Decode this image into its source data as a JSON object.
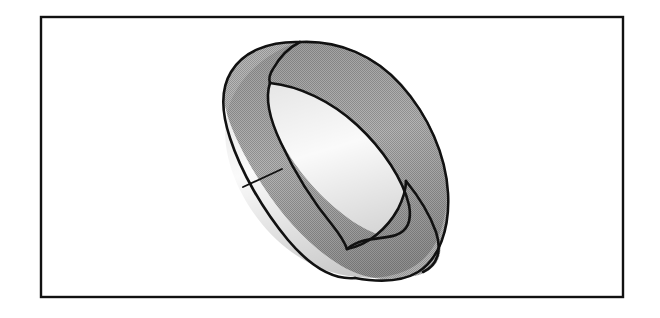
{
  "figure": {
    "title": "Mobius strip",
    "caption": "",
    "background_color": "#ffffff",
    "frame": {
      "name": "figure-border",
      "x": 41,
      "y": 17,
      "width": 582,
      "height": 280,
      "stroke_color": "#111111",
      "stroke_width": 2.4,
      "fill": "none"
    },
    "band": {
      "name": "mobius-band",
      "fill_color": "#ababab",
      "stroke_color": "#111111",
      "stroke_width": 2.6,
      "hole_color": "#ffffff",
      "description": "Gray shaded Mobius strip, one half-twist, viewed obliquely",
      "bounds": {
        "x_min": 222,
        "y_min": 38,
        "x_max": 450,
        "y_max": 280
      },
      "key_points": {
        "top_fold_vertex": [
          270,
          78
        ],
        "top_apex": [
          300,
          42
        ],
        "left_extreme": [
          224,
          148
        ],
        "right_crossing": [
          406,
          180
        ],
        "bottom_crossing": [
          345,
          249
        ],
        "right_extreme": [
          448,
          208
        ],
        "bottom_extreme": [
          330,
          277
        ]
      }
    },
    "seam": {
      "name": "band-seam-line",
      "from": [
        243,
        187
      ],
      "to": [
        282,
        169
      ],
      "stroke_color": "#111111",
      "stroke_width": 1.8
    },
    "shading": {
      "pattern": "halftone-dither",
      "light_gray": "#b4b4b4",
      "mid_gray": "#a6a6a6",
      "dark_edge": "#2a2a2a"
    }
  }
}
